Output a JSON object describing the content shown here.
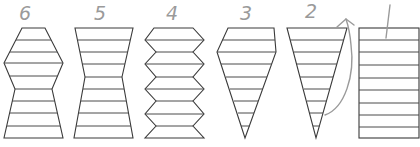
{
  "figure": {
    "stroke_color": "#3a3a3a",
    "pencil_color": "#9a9a9a",
    "background": "#ffffff"
  },
  "shapes": [
    {
      "label": "6",
      "form": "double-hexagon stack (wide middle, pinched lower waist)",
      "rungs": 9
    },
    {
      "label": "5",
      "form": "hourglass (narrow waist)",
      "rungs": 9
    },
    {
      "label": "4",
      "form": "zigzag accordion column",
      "rungs": 9
    },
    {
      "label": "3",
      "form": "kite / ice-cream cone (flat top, widest near top, pointed bottom)",
      "rungs": 9
    },
    {
      "label": "2",
      "form": "inverted triangle (cone)",
      "rungs": 9
    },
    {
      "label": "1",
      "form": "rectangle",
      "rungs": 9
    }
  ],
  "annotations": {
    "arrow": "hand-drawn curved arrow rising from shape 2 toward top right"
  }
}
